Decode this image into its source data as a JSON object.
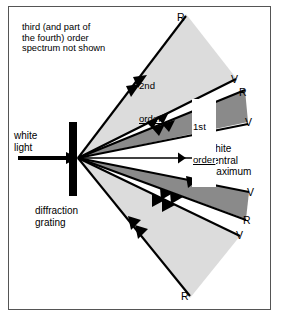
{
  "figure": {
    "background": "#ffffff",
    "frame_color": "#555555"
  },
  "colors": {
    "first_order_fill": "#8a8a8a",
    "second_order_fill": "#dcdcdc",
    "ray": "#000000",
    "grating": "#000000",
    "text": "#000000"
  },
  "annotations": {
    "not_shown_note": "third (and part of\nthe fourth) order\nspectrum not shown",
    "source_label": "white\nlight",
    "grating_label": "diffraction\ngrating",
    "central_label": "white\ncentral\nmaximum",
    "second_order_label_line1": "2nd",
    "second_order_label_line2": "order",
    "first_order_label_line1": "1st",
    "first_order_label_line2": "order"
  },
  "ray_labels": {
    "upper_second_red": "R",
    "upper_second_violet": "V",
    "upper_first_red": "R",
    "upper_first_violet": "V",
    "lower_first_violet": "V",
    "lower_first_red": "R",
    "lower_second_violet": "V",
    "lower_second_red": "R"
  },
  "legend_keys": {
    "R": "Red",
    "V": "Violet"
  },
  "geometry": {
    "grating_origin_x": 78,
    "grating_origin_y": 158,
    "grating_bar_top": 122,
    "grating_bar_bottom": 196,
    "central_axis_y": 158
  },
  "icons": {
    "incoming_beam": "arrow-right-icon",
    "central_beam": "double-arrow-right-icon",
    "order_marker": "arrowhead-icon"
  }
}
